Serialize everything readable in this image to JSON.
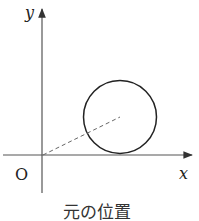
{
  "diagram": {
    "axis_labels": {
      "y": "y",
      "x": "x",
      "origin": "O"
    },
    "caption": "元の位置",
    "colors": {
      "axis": "#555555",
      "circle": "#222222",
      "dashed": "#666666"
    }
  }
}
